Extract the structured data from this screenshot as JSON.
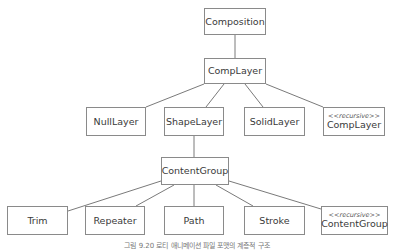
{
  "diagram": {
    "nodes": {
      "composition": {
        "label": "Composition"
      },
      "comp_layer": {
        "label": "CompLayer"
      },
      "null_layer": {
        "label": "NullLayer"
      },
      "shape_layer": {
        "label": "ShapeLayer"
      },
      "solid_layer": {
        "label": "SolidLayer"
      },
      "recursive_comp_layer": {
        "stereotype": "<<recursive>>",
        "label": "CompLayer"
      },
      "content_group": {
        "label": "ContentGroup"
      },
      "trim": {
        "label": "Trim"
      },
      "repeater": {
        "label": "Repeater"
      },
      "path": {
        "label": "Path"
      },
      "stroke": {
        "label": "Stroke"
      },
      "recursive_content_group": {
        "stereotype": "<<recursive>>",
        "label": "ContentGroup"
      }
    },
    "edges": [
      [
        "Composition",
        "CompLayer"
      ],
      [
        "CompLayer",
        "NullLayer"
      ],
      [
        "CompLayer",
        "ShapeLayer"
      ],
      [
        "CompLayer",
        "SolidLayer"
      ],
      [
        "CompLayer",
        "<<recursive>> CompLayer"
      ],
      [
        "ShapeLayer",
        "ContentGroup"
      ],
      [
        "ContentGroup",
        "Trim"
      ],
      [
        "ContentGroup",
        "Repeater"
      ],
      [
        "ContentGroup",
        "Path"
      ],
      [
        "ContentGroup",
        "Stroke"
      ],
      [
        "ContentGroup",
        "<<recursive>> ContentGroup"
      ]
    ],
    "caption": "그림 9.20 로티 애니메이션 파일 포맷의 계층적 구조"
  }
}
